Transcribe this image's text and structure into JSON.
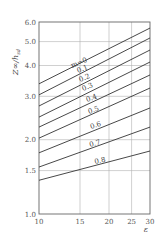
{
  "chart_data": {
    "type": "line",
    "title": "",
    "xlabel": "ε",
    "ylabel": "Z∞/h_sd",
    "xscale": "log",
    "yscale": "log",
    "xlim": [
      10,
      30
    ],
    "ylim": [
      1.0,
      6.0
    ],
    "grid": true,
    "legend": "none (inline curve labels)",
    "x_ticks": [
      "10",
      "15",
      "20",
      "25",
      "30"
    ],
    "y_ticks": [
      "1.0",
      "1.5",
      "2.0",
      "3.0",
      "4.0",
      "5.0",
      "6.0"
    ],
    "x": [
      10,
      30
    ],
    "series": [
      {
        "name": "m=0",
        "label": "m=0",
        "values": [
          3.37,
          5.67
        ]
      },
      {
        "name": "0.1",
        "label": "0.1",
        "values": [
          3.04,
          5.17
        ]
      },
      {
        "name": "0.2",
        "label": "0.2",
        "values": [
          2.74,
          4.62
        ]
      },
      {
        "name": "0.3",
        "label": "0.3",
        "values": [
          2.47,
          4.13
        ]
      },
      {
        "name": "0.4",
        "label": "0.4",
        "values": [
          2.25,
          3.66
        ]
      },
      {
        "name": "0.5",
        "label": "0.5",
        "values": [
          2.03,
          3.24
        ]
      },
      {
        "name": "0.6",
        "label": "0.6",
        "values": [
          1.77,
          2.69
        ]
      },
      {
        "name": "0.7",
        "label": "0.7",
        "values": [
          1.55,
          2.25
        ]
      },
      {
        "name": "0.8",
        "label": "0.8",
        "values": [
          1.37,
          1.8
        ]
      }
    ]
  },
  "labels": {
    "y_axis_title": "Z∞/h",
    "y_axis_sub": "sd",
    "x_axis_title": "ε",
    "y_ticks": [
      "6.0",
      "5.0",
      "4.0",
      "3.0",
      "2.0",
      "1.5",
      "1.0"
    ],
    "x_ticks": [
      "10",
      "15",
      "20",
      "25",
      "30"
    ],
    "curve_labels": [
      "m=0",
      "0.1",
      "0.2",
      "0.3",
      "0.4",
      "0.5",
      "0.6",
      "0.7",
      "0.8"
    ]
  },
  "colors": {
    "frame": "#666666",
    "grid": "#aaaaaa",
    "curve": "#333333",
    "text": "#555555"
  }
}
